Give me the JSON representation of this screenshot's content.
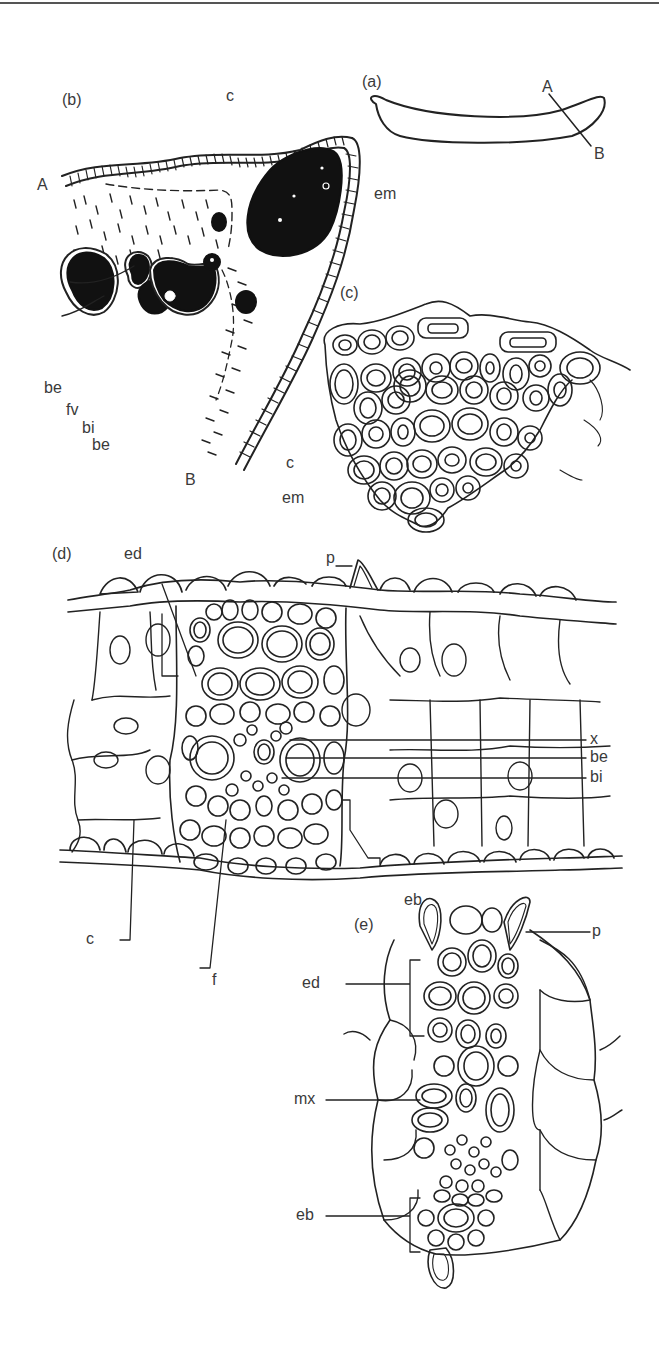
{
  "figure": {
    "panels": [
      {
        "id": "a",
        "label": "(a)",
        "section_line": {
          "start": "A",
          "end": "B"
        }
      },
      {
        "id": "b",
        "label": "(b)",
        "markers": [
          "A",
          "B"
        ],
        "callouts": [
          "c",
          "em",
          "be",
          "fv",
          "bi",
          "be",
          "c"
        ]
      },
      {
        "id": "c",
        "label": "(c)",
        "callouts": [
          "em"
        ]
      },
      {
        "id": "d",
        "label": "(d)",
        "callouts": [
          "ed",
          "p",
          "x",
          "be",
          "bi",
          "eb",
          "c",
          "f"
        ]
      },
      {
        "id": "e",
        "label": "(e)",
        "callouts": [
          "p",
          "ed",
          "mx",
          "eb"
        ]
      }
    ],
    "labels": {
      "a_panel": "(a)",
      "a_A": "A",
      "a_B": "B",
      "b_panel": "(b)",
      "b_A": "A",
      "b_B": "B",
      "b_c_top": "c",
      "b_em": "em",
      "b_be1": "be",
      "b_fv": "fv",
      "b_bi": "bi",
      "b_be2": "be",
      "b_c_bottom": "c",
      "c_panel": "(c)",
      "c_em": "em",
      "d_panel": "(d)",
      "d_ed": "ed",
      "d_p": "p",
      "d_x": "x",
      "d_be": "be",
      "d_bi": "bi",
      "d_eb": "eb",
      "d_c": "c",
      "d_f": "f",
      "e_panel": "(e)",
      "e_p": "p",
      "e_ed": "ed",
      "e_mx": "mx",
      "e_eb": "eb"
    },
    "colors": {
      "ink": "#222222",
      "label": "#3a3a3a",
      "background": "#ffffff"
    }
  }
}
